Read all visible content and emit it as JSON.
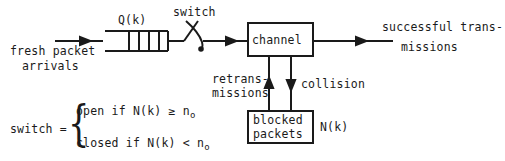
{
  "diagram": {
    "labels": {
      "queue": "Q(k)",
      "switch": "switch",
      "channel": "channel",
      "fresh_line1": "fresh packet",
      "fresh_line2": "arrivals",
      "success_line1": "successful trans-",
      "success_line2": "missions",
      "retrans_line1": "retrans-",
      "retrans_line2": "missions",
      "collision": "collision",
      "blocked_line1": "blocked",
      "blocked_line2": "packets",
      "backlog": "N(k)"
    },
    "formula": {
      "lhs": "switch =",
      "case_open": "open if N(k) ≥ n",
      "case_open_sub": "o",
      "case_closed": "closed if N(k) < n",
      "case_closed_sub": "o"
    },
    "queue_cells": 4,
    "colors": {
      "stroke": "#1a1a1a",
      "background": "#ffffff"
    }
  }
}
